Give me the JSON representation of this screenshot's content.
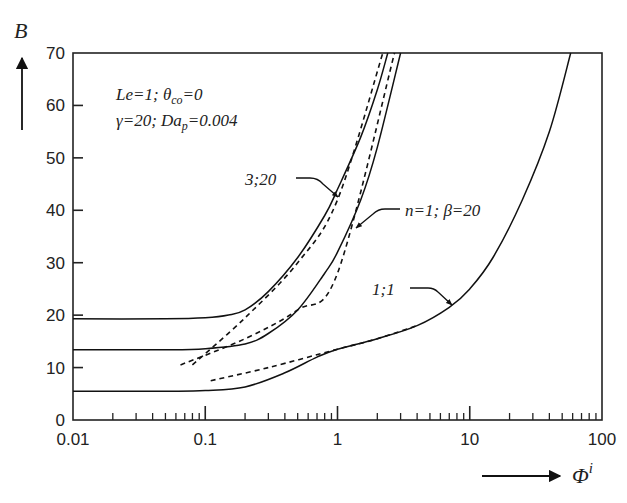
{
  "chart_data": {
    "type": "line",
    "title": "",
    "xlabel": "Φ^i",
    "ylabel": "B",
    "x_scale": "log",
    "xlim": [
      0.01,
      100
    ],
    "ylim": [
      0,
      70
    ],
    "x_ticks": [
      "0.01",
      "0.1",
      "1",
      "10",
      "100"
    ],
    "y_ticks": [
      "0",
      "10",
      "20",
      "30",
      "40",
      "50",
      "60",
      "70"
    ],
    "grid": false,
    "annotation": {
      "line1": "Le=1; θco=0",
      "line2": "γ=20; Dap=0.004"
    },
    "series": [
      {
        "name": "3;20",
        "style": "solid",
        "x": [
          0.01,
          0.05,
          0.1,
          0.15,
          0.2,
          0.3,
          0.5,
          0.8,
          1.0,
          1.5,
          2.0,
          2.4
        ],
        "y": [
          19.3,
          19.3,
          19.5,
          20.0,
          21.0,
          24.5,
          31.0,
          39.0,
          44.0,
          54.0,
          63.0,
          70.0
        ]
      },
      {
        "name": "3;20 asymptote",
        "style": "dashed",
        "x": [
          0.08,
          0.2,
          0.5,
          1.0,
          2.2
        ],
        "y": [
          10.5,
          19.5,
          30.0,
          42.0,
          70.0
        ]
      },
      {
        "name": "n=1; β=20",
        "style": "solid",
        "x": [
          0.01,
          0.05,
          0.1,
          0.2,
          0.3,
          0.5,
          0.8,
          1.0,
          1.5,
          2.0,
          3.0
        ],
        "y": [
          13.4,
          13.4,
          13.6,
          14.5,
          16.5,
          21.0,
          28.0,
          32.0,
          42.0,
          52.0,
          70.0
        ]
      },
      {
        "name": "n=1; β=20 asymptote",
        "style": "dashed",
        "x": [
          0.065,
          0.2,
          0.5,
          1.0,
          2.7
        ],
        "y": [
          10.5,
          15.5,
          21.0,
          28.0,
          70.0
        ]
      },
      {
        "name": "1;1",
        "style": "solid",
        "x": [
          0.01,
          0.05,
          0.1,
          0.2,
          0.4,
          0.7,
          1.0,
          2.0,
          4.0,
          7.0,
          10.0,
          15.0,
          25.0,
          40.0,
          58.0
        ],
        "y": [
          5.5,
          5.5,
          5.6,
          6.3,
          9.0,
          12.0,
          13.5,
          15.5,
          18.0,
          21.5,
          25.0,
          31.0,
          42.0,
          55.0,
          70.0
        ]
      },
      {
        "name": "1;1 asymptote",
        "style": "dashed",
        "x": [
          0.11,
          0.3,
          1.0,
          2.0,
          4.0
        ],
        "y": [
          7.5,
          10.0,
          13.5,
          15.5,
          18.0
        ]
      }
    ],
    "curve_labels": [
      "3;20",
      "n=1; β=20",
      "1;1"
    ]
  }
}
